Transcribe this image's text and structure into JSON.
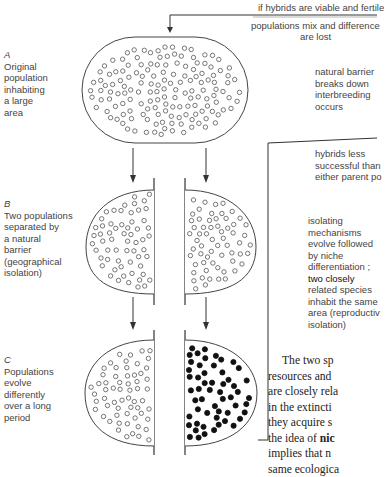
{
  "stages": [
    {
      "letter": "A",
      "lines": [
        "Original",
        "population",
        "inhabiting",
        "a large",
        "area"
      ]
    },
    {
      "letter": "B",
      "lines": [
        "Two populations",
        "separated by",
        "a natural",
        "barrier",
        "(geographical",
        "isolation)"
      ]
    },
    {
      "letter": "C",
      "lines": [
        "Populations",
        "evolve",
        "differently",
        "over a long",
        "period"
      ]
    }
  ],
  "annotations": {
    "top_condition": "if hybrids are viable and fertile",
    "mix_line1": "populations mix and difference",
    "mix_line2": "are lost",
    "barrier": [
      "natural barrier",
      "breaks down",
      "interbreeding",
      "occurs"
    ],
    "hybrids": [
      "hybrids less",
      "successful than",
      "either parent po"
    ],
    "isolating": [
      "isolating",
      "mechanisms",
      "evolve followed",
      "by niche",
      "differentiation ;"
    ],
    "isolating_bold": "two closely",
    "isolating_rest": [
      "related species",
      "inhabit the same",
      "area (reproductiv",
      "isolation)"
    ]
  },
  "prose": {
    "lines": [
      "The two sp",
      "resources and",
      "are closely rela",
      "in the extincti",
      "they acquire s",
      "the idea of ",
      "implies that n",
      "same ecologica"
    ],
    "bold_term": "nic"
  },
  "colors": {
    "line": "#333333",
    "open_circle": "#555555",
    "filled_circle": "#111111"
  }
}
